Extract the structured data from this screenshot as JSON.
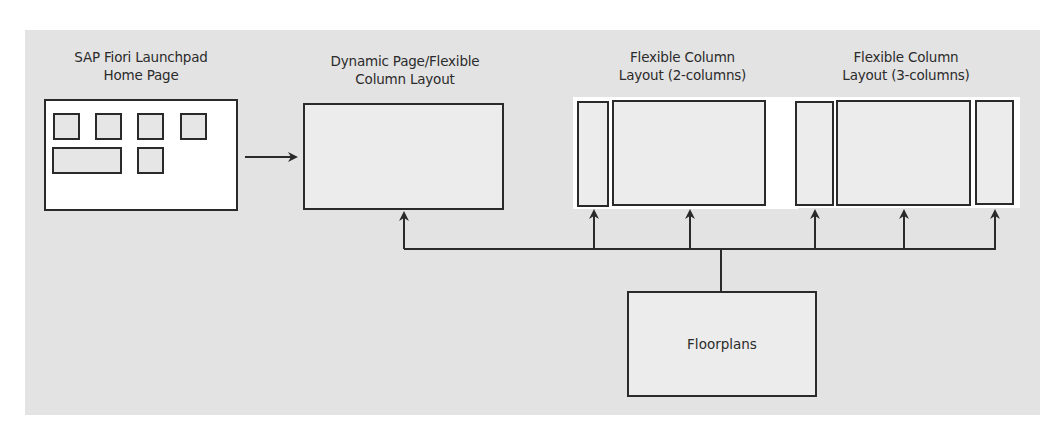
{
  "diagram": {
    "background_color": "#e3e3e3",
    "line_color": "#2a2a2a",
    "nodes": {
      "launchpad": {
        "title_line1": "SAP Fiori Launchpad",
        "title_line2": "Home Page",
        "tiles": 6
      },
      "dynamic_page": {
        "title_line1": "Dynamic Page/Flexible",
        "title_line2": "Column Layout"
      },
      "fcl_2col": {
        "title_line1": "Flexible Column",
        "title_line2": "Layout (2-columns)",
        "columns": 2
      },
      "fcl_3col": {
        "title_line1": "Flexible Column",
        "title_line2": "Layout (3-columns)",
        "columns": 3
      },
      "floorplans": {
        "label": "Floorplans"
      }
    },
    "edges": [
      {
        "from": "launchpad",
        "to": "dynamic_page",
        "type": "arrow"
      },
      {
        "from": "floorplans",
        "to": "dynamic_page",
        "type": "arrow"
      },
      {
        "from": "floorplans",
        "to": "fcl_2col.column1",
        "type": "arrow"
      },
      {
        "from": "floorplans",
        "to": "fcl_2col.column2",
        "type": "arrow"
      },
      {
        "from": "floorplans",
        "to": "fcl_3col.column1",
        "type": "arrow"
      },
      {
        "from": "floorplans",
        "to": "fcl_3col.column2",
        "type": "arrow"
      },
      {
        "from": "floorplans",
        "to": "fcl_3col.column3",
        "type": "arrow"
      }
    ]
  }
}
